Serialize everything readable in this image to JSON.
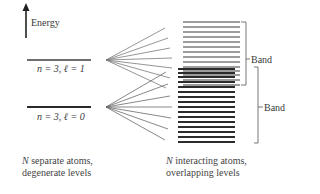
{
  "axis": {
    "label": "Energy",
    "icon": "up-arrow-icon"
  },
  "levels": [
    {
      "id": "upper",
      "label": "n = 3, ℓ = 1",
      "n": 3,
      "l": 1,
      "color": "#6e6e6e"
    },
    {
      "id": "lower",
      "label": "n = 3, ℓ = 0",
      "n": 3,
      "l": 0,
      "color": "#2a2a2a"
    }
  ],
  "bands": [
    {
      "id": "upper-band",
      "label": "Band",
      "color": "#7a7a7a",
      "line_count": 14
    },
    {
      "id": "lower-band",
      "label": "Band",
      "color": "#2b2b2b",
      "line_count": 15
    }
  ],
  "captions": {
    "left": {
      "italic_prefix": "N",
      "line1_rest": " separate atoms,",
      "line2": "degenerate levels"
    },
    "right": {
      "italic_prefix": "N",
      "line1_rest": " interacting atoms,",
      "line2": "overlapping levels"
    }
  }
}
